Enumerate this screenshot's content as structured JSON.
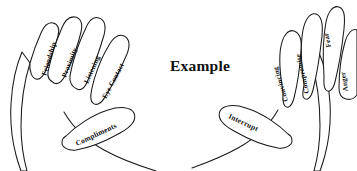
{
  "figure": {
    "title": "Example",
    "background_color": "#ffffff",
    "ink_color": "#1a1a1a",
    "clipped_top_text": "",
    "type": "two-hand labeled diagram"
  },
  "left_hand": {
    "name": "left-hand",
    "fingers": [
      {
        "id": "pinky",
        "label": "Friendship"
      },
      {
        "id": "ring",
        "label": "Proximity"
      },
      {
        "id": "middle",
        "label": "Listening"
      },
      {
        "id": "index",
        "label": "Eye Contact"
      }
    ],
    "thumb": {
      "id": "thumb",
      "label": "Compliments"
    }
  },
  "right_hand": {
    "name": "right-hand",
    "fingers": [
      {
        "id": "index",
        "label": "Convincing"
      },
      {
        "id": "middle",
        "label": "Compromise"
      },
      {
        "id": "ring",
        "label": "Fear"
      },
      {
        "id": "pinky",
        "label": "Anger"
      }
    ],
    "thumb": {
      "id": "thumb",
      "label": "Interrupt"
    }
  }
}
